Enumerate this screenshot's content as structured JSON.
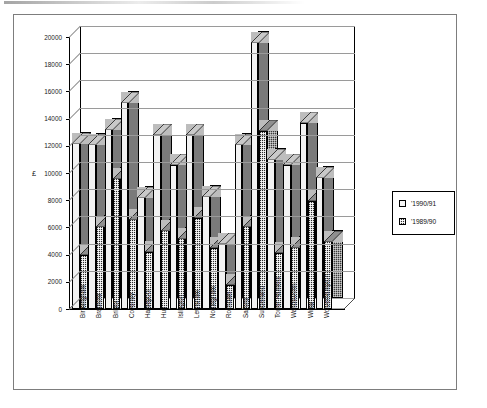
{
  "figure": {
    "y_axis_title": "£",
    "border_color": "#7d7d7d"
  },
  "legend": {
    "entries": [
      {
        "label": "'1990/91",
        "swatch": "light-swatch-icon",
        "color": "#f5f5f5"
      },
      {
        "label": "'1989/90",
        "swatch": "dark-checkered-swatch-icon",
        "color": "#2b2b2b"
      }
    ]
  },
  "chart_data": {
    "type": "bar",
    "title": "",
    "xlabel": "",
    "ylabel": "£",
    "ylim": [
      0,
      20000
    ],
    "ytick_step": 2000,
    "yticks": [
      0,
      2000,
      4000,
      6000,
      8000,
      10000,
      12000,
      14000,
      16000,
      18000,
      20000
    ],
    "ytick_labels": [
      "0",
      "2000",
      "4000",
      "6000",
      "8000",
      "10000",
      "12000",
      "14000",
      "16000",
      "18000",
      "20000"
    ],
    "grid": true,
    "legend_position": "right-outside",
    "style": "3d-clustered-columns",
    "categories": [
      "Birmingham",
      "Bradford",
      "Bristol",
      "Coventry",
      "Hartlepool",
      "Hull",
      "Islington",
      "Lewisham",
      "Nottingham",
      "Rochdale",
      "Salford",
      "Sunderland",
      "Tower Hamlets",
      "Wandsworth",
      "Wirral",
      "Wolverhampton"
    ],
    "series": [
      {
        "name": "'1990/91",
        "color": "#f2f2f2",
        "values": [
          12200,
          12100,
          13200,
          15200,
          8200,
          12800,
          10600,
          12800,
          8300,
          4800,
          12100,
          19600,
          11000,
          10600,
          13700,
          9700
        ]
      },
      {
        "name": "'1989/90",
        "color": "#2b2b2b",
        "values": [
          4000,
          6100,
          9600,
          6600,
          4200,
          5800,
          5200,
          6700,
          4500,
          1800,
          6100,
          13100,
          4150,
          4550,
          7950,
          5000
        ]
      }
    ]
  }
}
